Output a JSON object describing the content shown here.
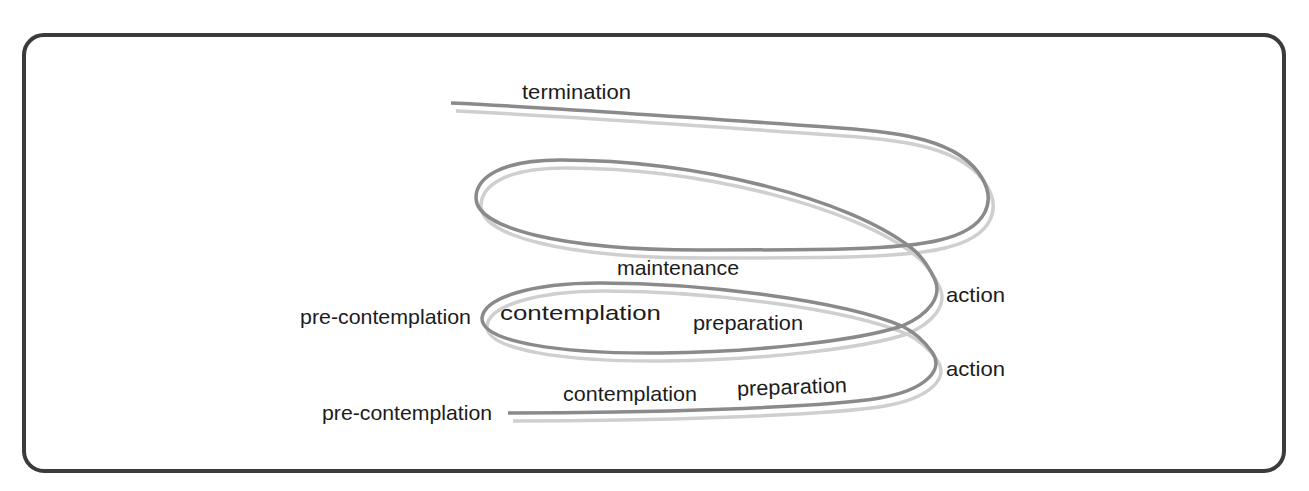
{
  "diagram": {
    "type": "spiral-of-change",
    "colors": {
      "frame": "#3b3b3b",
      "curve": "#8a8a8a",
      "curve_shadow": "#cfcfcf",
      "text": "#1c1c1c",
      "background": "#ffffff"
    },
    "labels": {
      "termination": "termination",
      "maintenance": "maintenance",
      "action_upper": "action",
      "action_lower": "action",
      "loop_upper": {
        "pre_contemplation": "pre-contemplation",
        "contemplation": "contemplation",
        "preparation": "preparation"
      },
      "loop_lower": {
        "pre_contemplation": "pre-contemplation",
        "contemplation": "contemplation",
        "preparation": "preparation"
      }
    }
  }
}
